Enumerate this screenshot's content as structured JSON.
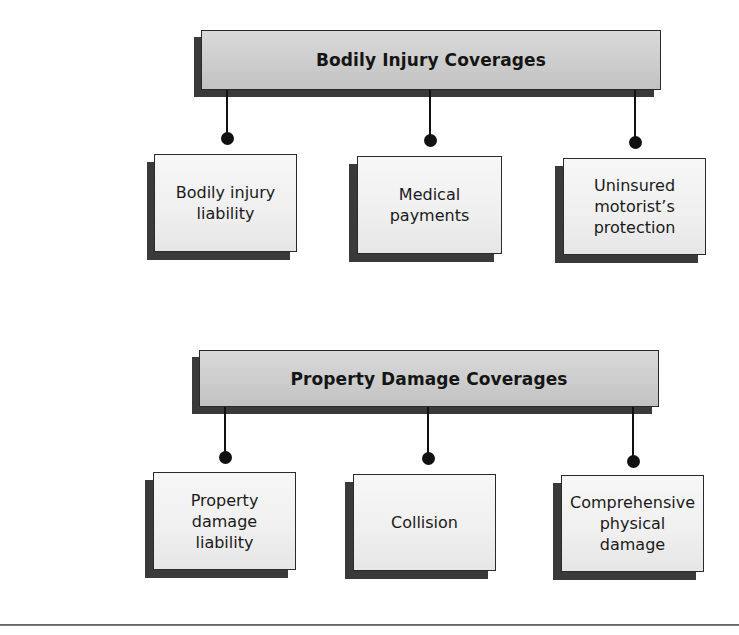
{
  "diagram": {
    "type": "hierarchy",
    "sections": [
      {
        "title": "Bodily Injury Coverages",
        "children": [
          {
            "label": "Bodily injury\nliability"
          },
          {
            "label": "Medical\npayments"
          },
          {
            "label": "Uninsured\nmotorist’s\nprotection"
          }
        ]
      },
      {
        "title": "Property Damage Coverages",
        "children": [
          {
            "label": "Property\ndamage\nliability"
          },
          {
            "label": "Collision"
          },
          {
            "label": "Comprehensive\nphysical\ndamage"
          }
        ]
      }
    ]
  },
  "colors": {
    "header_fill": "#cfcfcf",
    "child_fill": "#efefef",
    "shadow": "#3a3a3a",
    "line": "#111111"
  }
}
